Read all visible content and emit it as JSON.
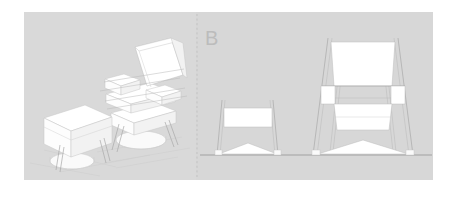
{
  "document": {
    "title": "Lounge Chair and Ottoman — Perspective and Section B",
    "background_color": "#ffffff"
  },
  "panels": [
    {
      "id": "perspective-panel",
      "label": "",
      "background_color": "#d9d9d9",
      "x": 24,
      "y": 12,
      "width": 172,
      "height": 168,
      "view_type": "3d-perspective",
      "objects": [
        {
          "name": "lounge-chair",
          "parts": [
            "backrest",
            "left-armrest",
            "right-armrest",
            "seat-cushion",
            "base-plinth",
            "pedestal-foot"
          ]
        },
        {
          "name": "ottoman",
          "parts": [
            "top-cushion",
            "body",
            "pedestal-foot"
          ]
        }
      ]
    },
    {
      "id": "elevation-panel",
      "label": "B",
      "label_color": "#bcbcbc",
      "background_color": "#d7d7d7",
      "x": 196,
      "y": 12,
      "width": 237,
      "height": 168,
      "view_type": "orthographic-elevation",
      "ground_line_y": 155,
      "objects": [
        {
          "name": "ottoman-elevation",
          "parts": [
            "cushion-slab",
            "left-leg",
            "right-leg",
            "arched-base"
          ]
        },
        {
          "name": "chair-elevation",
          "parts": [
            "backrest-slab",
            "armrest-block-left",
            "armrest-block-right",
            "armrest-rail",
            "seat-slab",
            "left-leg",
            "right-leg",
            "arched-base"
          ]
        }
      ]
    }
  ],
  "annotations": {
    "section_letter": "B",
    "divider": {
      "name": "section-divider",
      "style": "dashed-vertical",
      "x": 196,
      "color": "#b9b9b9"
    }
  }
}
